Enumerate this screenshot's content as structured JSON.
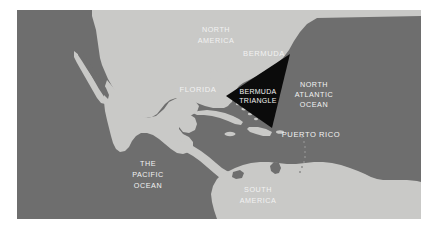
{
  "map": {
    "title": "Bermuda Triangle Map",
    "colors": {
      "ocean": "#6e6e6e",
      "land": "#c9c9c7",
      "triangle": "#0b0b0b",
      "label_text": "#f2f2f2",
      "page_background": "#ffffff"
    },
    "labels": {
      "north_america_line1": "NORTH",
      "north_america_line2": "AMERICA",
      "bermuda": "BERMUDA",
      "florida": "FLORIDA",
      "bermuda_triangle_line1": "BERMUDA",
      "bermuda_triangle_line2": "TRIANGLE",
      "north_atlantic_line1": "NORTH",
      "north_atlantic_line2": "ATLANTIC",
      "north_atlantic_line3": "OCEAN",
      "puerto_rico": "PUERTO RICO",
      "pacific_line1": "THE",
      "pacific_line2": "PACIFIC",
      "pacific_line3": "OCEAN",
      "south_america_line1": "SOUTH",
      "south_america_line2": "AMERICA"
    },
    "regions": [
      "NORTH AMERICA",
      "BERMUDA",
      "FLORIDA",
      "BERMUDA TRIANGLE",
      "NORTH ATLANTIC OCEAN",
      "PUERTO RICO",
      "THE PACIFIC OCEAN",
      "SOUTH AMERICA"
    ]
  }
}
